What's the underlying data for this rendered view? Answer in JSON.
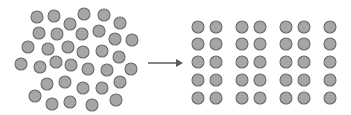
{
  "diagram": {
    "colors": {
      "fill": "#a6a6a6",
      "stroke": "#6b6b6b",
      "arrow": "#5a5a5a"
    },
    "radius": 6,
    "disordered": [
      [
        37,
        17
      ],
      [
        54,
        16
      ],
      [
        84,
        14
      ],
      [
        104,
        15
      ],
      [
        70,
        24
      ],
      [
        120,
        23
      ],
      [
        39,
        33
      ],
      [
        57,
        34
      ],
      [
        82,
        34
      ],
      [
        99,
        31
      ],
      [
        115,
        39
      ],
      [
        132,
        40
      ],
      [
        28,
        47
      ],
      [
        48,
        49
      ],
      [
        68,
        47
      ],
      [
        83,
        52
      ],
      [
        102,
        51
      ],
      [
        119,
        57
      ],
      [
        21,
        64
      ],
      [
        40,
        67
      ],
      [
        56,
        62
      ],
      [
        71,
        65
      ],
      [
        88,
        69
      ],
      [
        107,
        70
      ],
      [
        131,
        69
      ],
      [
        47,
        84
      ],
      [
        65,
        82
      ],
      [
        83,
        88
      ],
      [
        102,
        88
      ],
      [
        120,
        82
      ],
      [
        35,
        96
      ],
      [
        52,
        104
      ],
      [
        70,
        102
      ],
      [
        92,
        105
      ],
      [
        116,
        100
      ]
    ],
    "arrow": {
      "x1": 148,
      "y1": 63,
      "x2": 183,
      "y2": 63
    },
    "grid": {
      "columns": [
        198,
        216,
        242,
        260,
        286,
        304,
        330
      ],
      "rows": [
        27,
        44,
        62,
        80,
        98
      ]
    }
  }
}
